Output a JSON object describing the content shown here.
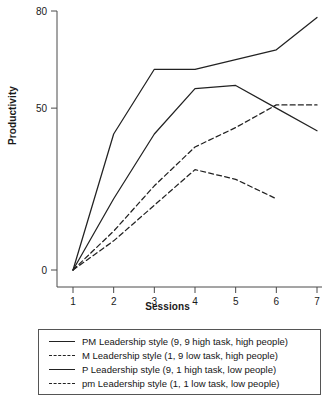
{
  "chart_data": {
    "type": "line",
    "title": "",
    "xlabel": "Sessions",
    "ylabel": "Productivity",
    "x": [
      1,
      2,
      3,
      4,
      5,
      6,
      7
    ],
    "xticklabels": [
      "1",
      "2",
      "3",
      "4",
      "5",
      "6",
      "7"
    ],
    "yticks": [
      0,
      50,
      80
    ],
    "yticklabels": [
      "0",
      "50",
      "80"
    ],
    "xlim": [
      0.6,
      7.2
    ],
    "ylim": [
      0,
      80
    ],
    "grid": false,
    "legend_position": "below-axes",
    "series": [
      {
        "name": "PM Leadership style (9, 9 high task, high people)",
        "style": "solid",
        "color": "#222222",
        "x": [
          1,
          2,
          3,
          4,
          5,
          6,
          7
        ],
        "values": [
          0,
          42,
          62,
          62,
          65,
          68,
          78
        ]
      },
      {
        "name": "M Leadership style (1, 9 low task, high people)",
        "style": "dashed",
        "color": "#222222",
        "x": [
          1,
          2,
          3,
          4,
          5,
          6,
          7
        ],
        "values": [
          0,
          12,
          26,
          38,
          44,
          51,
          51
        ]
      },
      {
        "name": "P Leadership style (9, 1 high task, low people)",
        "style": "solid",
        "color": "#222222",
        "x": [
          1,
          2,
          3,
          4,
          5,
          6,
          7
        ],
        "values": [
          0,
          22,
          42,
          56,
          57,
          50,
          43
        ]
      },
      {
        "name": "pm Leadership style (1, 1 low task, low people)",
        "style": "dashed",
        "color": "#222222",
        "x": [
          1,
          2,
          3,
          4,
          5,
          6
        ],
        "values": [
          0,
          9,
          20,
          31,
          28,
          22
        ]
      }
    ]
  },
  "axes": {
    "ylabel": "Productivity",
    "xlabel": "Sessions"
  },
  "legend": {
    "items": [
      {
        "label": "PM Leadership style (9, 9 high task, high people)",
        "style": "solid"
      },
      {
        "label": "M Leadership style (1, 9 low task, high people)",
        "style": "dashed"
      },
      {
        "label": "P Leadership style (9, 1 high task, low people)",
        "style": "solid"
      },
      {
        "label": "pm Leadership style (1, 1 low task, low people)",
        "style": "dashed"
      }
    ]
  }
}
